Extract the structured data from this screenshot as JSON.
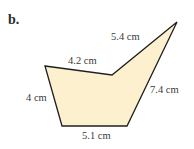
{
  "figure": {
    "part_label": "b.",
    "shape": "concave pentagon",
    "fill_color": "#FCF0CF",
    "stroke_color": "#1f1f1f",
    "vertices": [
      {
        "name": "top-left",
        "x": 45,
        "y": 66
      },
      {
        "name": "notch",
        "x": 112,
        "y": 75
      },
      {
        "name": "top-right",
        "x": 177,
        "y": 22
      },
      {
        "name": "bottom-right",
        "x": 127,
        "y": 126
      },
      {
        "name": "bottom-left",
        "x": 62,
        "y": 126
      }
    ],
    "sides": [
      {
        "id": "top-left-side",
        "label": "4.2 cm"
      },
      {
        "id": "top-right-side",
        "label": "5.4 cm"
      },
      {
        "id": "right-side",
        "label": "7.4 cm"
      },
      {
        "id": "bottom-side",
        "label": "5.1 cm"
      },
      {
        "id": "left-side",
        "label": "4 cm"
      }
    ]
  }
}
